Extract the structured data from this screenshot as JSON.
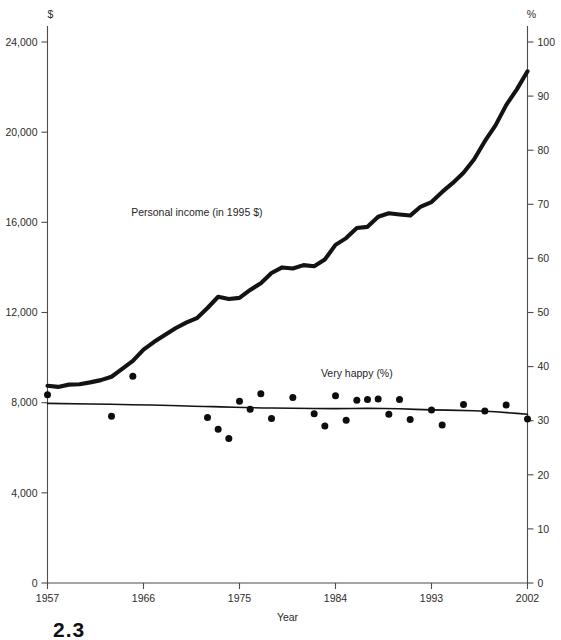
{
  "figure": {
    "number": "2.3",
    "left_axis_unit": "$",
    "right_axis_unit": "%",
    "xlabel": "Year"
  },
  "chart_data": {
    "type": "line",
    "title": "",
    "subtitle": "",
    "xlabel": "Year",
    "ylabel": "$",
    "y2label": "%",
    "xlim": [
      1957,
      2002
    ],
    "ylim": [
      0,
      24000
    ],
    "y2lim": [
      0,
      100
    ],
    "grid": false,
    "legend": "inline-annotation",
    "xticks": [
      1957,
      1966,
      1975,
      1984,
      1993,
      2002
    ],
    "xticklabels": [
      "1957",
      "1966",
      "1975",
      "1984",
      "1993",
      "2002"
    ],
    "yticks": [
      0,
      4000,
      8000,
      12000,
      16000,
      20000,
      24000
    ],
    "yticklabels": [
      "0",
      "4,000",
      "8,000",
      "12,000",
      "16,000",
      "20,000",
      "24,000"
    ],
    "y2ticks": [
      0,
      10,
      20,
      30,
      40,
      50,
      60,
      70,
      80,
      90,
      100
    ],
    "y2ticklabels": [
      "0",
      "10",
      "20",
      "30",
      "40",
      "50",
      "60",
      "70",
      "80",
      "90",
      "100"
    ],
    "annotations": [
      {
        "text": "Personal income (in 1995 $)",
        "x": 1971,
        "y": 16300
      },
      {
        "text": "Very happy (%)",
        "x": 1986,
        "y": 9150
      }
    ],
    "series": [
      {
        "name": "Personal income (in 1995 $)",
        "axis": "left",
        "style": "thick-line",
        "x": [
          1957,
          1958,
          1959,
          1960,
          1961,
          1962,
          1963,
          1964,
          1965,
          1966,
          1967,
          1968,
          1969,
          1970,
          1971,
          1972,
          1973,
          1974,
          1975,
          1976,
          1977,
          1978,
          1979,
          1980,
          1981,
          1982,
          1983,
          1984,
          1985,
          1986,
          1987,
          1988,
          1989,
          1990,
          1991,
          1992,
          1993,
          1994,
          1995,
          1996,
          1997,
          1998,
          1999,
          2000,
          2001,
          2002
        ],
        "values": [
          8750,
          8700,
          8800,
          8820,
          8900,
          9000,
          9150,
          9500,
          9850,
          10350,
          10700,
          11000,
          11300,
          11550,
          11750,
          12200,
          12700,
          12600,
          12650,
          13000,
          13300,
          13750,
          14000,
          13950,
          14100,
          14050,
          14350,
          15000,
          15300,
          15750,
          15800,
          16250,
          16400,
          16350,
          16300,
          16700,
          16900,
          17350,
          17750,
          18200,
          18800,
          19600,
          20300,
          21200,
          21900,
          22700
        ]
      },
      {
        "name": "Very happy (%) trend",
        "axis": "right",
        "style": "thin-line",
        "x": [
          1957,
          1965,
          1972,
          1973,
          1976,
          1980,
          1984,
          1987,
          1990,
          1993,
          1996,
          1998,
          2000,
          2002
        ],
        "values": [
          33.2,
          33.0,
          32.6,
          32.6,
          32.4,
          32.3,
          32.2,
          32.3,
          32.2,
          32.0,
          31.9,
          31.8,
          31.5,
          31.2
        ]
      },
      {
        "name": "Very happy (%) observations",
        "axis": "right",
        "style": "scatter",
        "x": [
          1957,
          1963,
          1965,
          1972,
          1973,
          1974,
          1975,
          1976,
          1977,
          1978,
          1980,
          1982,
          1983,
          1984,
          1985,
          1986,
          1987,
          1988,
          1989,
          1990,
          1991,
          1993,
          1994,
          1996,
          1998,
          2000,
          2002
        ],
        "values": [
          34.8,
          30.8,
          38.2,
          30.6,
          28.4,
          26.7,
          33.6,
          32.1,
          35.0,
          30.4,
          34.3,
          31.3,
          29.0,
          34.6,
          30.1,
          33.8,
          33.9,
          34.0,
          31.2,
          33.9,
          30.2,
          32.0,
          29.2,
          33.0,
          31.8,
          32.9,
          30.3
        ]
      }
    ]
  }
}
